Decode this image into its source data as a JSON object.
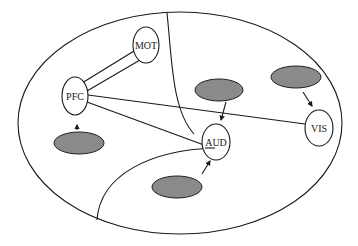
{
  "diagram": {
    "type": "brain-region schematic",
    "colors": {
      "line": "#1a1a1a",
      "background": "#ffffff",
      "input_blob_fill": "#8a8a8a"
    },
    "nodes": {
      "mot": {
        "label": "MOT"
      },
      "pfc": {
        "label": "PFC"
      },
      "aud": {
        "label": "AUD"
      },
      "vis": {
        "label": "VIS"
      }
    },
    "connections": [
      {
        "from": "PFC",
        "to": "MOT",
        "style": "double-line"
      },
      {
        "from": "PFC",
        "to": "VIS",
        "style": "single-line"
      },
      {
        "from": "PFC",
        "to": "AUD",
        "style": "single-line"
      }
    ],
    "inputs": [
      {
        "target": "PFC",
        "position": "below",
        "arrow": "up"
      },
      {
        "target": "AUD",
        "position": "above",
        "arrow": "down"
      },
      {
        "target": "AUD",
        "position": "below",
        "arrow": "up"
      },
      {
        "target": "VIS",
        "position": "above",
        "arrow": "down"
      }
    ]
  }
}
